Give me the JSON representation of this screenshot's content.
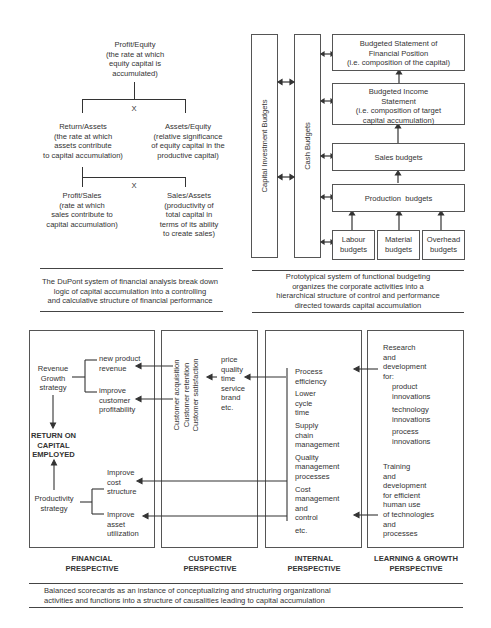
{
  "dupont": {
    "root": [
      "Profit/Equity",
      "(the rate at which",
      "equity capital is",
      "accumulated)"
    ],
    "multiply1": "X",
    "return_assets": [
      "Return/Assets",
      "(the rate at which",
      "assets contribute",
      "to capital accumulation)"
    ],
    "assets_equity": [
      "Assets/Equity",
      "(relative significance",
      "of equity capital in the",
      "productive capital)"
    ],
    "multiply2": "X",
    "profit_sales": [
      "Profit/Sales",
      "(rate at which",
      "sales contribute to",
      "capital accumulation)"
    ],
    "sales_assets": [
      "Sales/Assets",
      "(productivity of",
      "total capital in",
      "terms of its ability",
      "to create sales)"
    ],
    "caption": [
      "The DuPont system of financial analysis break down",
      "logic of capital accumulation into a controlling",
      "and calculative structure of financial performance"
    ]
  },
  "budgeting": {
    "capital_investment": "Capital Investment Budgets",
    "cash": "Cash Budgets",
    "statement_position": [
      "Budgeted Statement of",
      "Financial Position",
      "(i.e. composition of the capital)"
    ],
    "income_statement": [
      "Budgeted Income",
      "Statement",
      "(i.e. composition of target",
      "capital accumulation)"
    ],
    "sales": "Sales budgets",
    "production": "Production  budgets",
    "labour": [
      "Labour",
      "budgets"
    ],
    "material": [
      "Material",
      "budgets"
    ],
    "overhead": [
      "Overhead",
      "budgets"
    ],
    "caption": [
      "Prototypical system of functional budgeting",
      "organizes the corporate activities into a",
      "hierarchical structure of control and performance",
      "directed towards capital accumulation"
    ]
  },
  "scorecard": {
    "financial": {
      "revenue_growth": [
        "Revenue",
        "Growth",
        "strategy"
      ],
      "new_product": [
        "new product",
        "revenue"
      ],
      "improve_profitability": [
        "improve",
        "customer",
        "profitability"
      ],
      "roce": [
        "RETURN ON",
        "CAPITAL",
        "EMPLOYED"
      ],
      "productivity": [
        "Productivity",
        "strategy"
      ],
      "improve_cost": [
        "Improve",
        "cost",
        "structure"
      ],
      "improve_asset": [
        "Improve",
        "asset",
        "utilization"
      ],
      "label": [
        "FINANCIAL",
        "PRESPECTIVE"
      ]
    },
    "customer": {
      "rotated": [
        "Customer acquisition",
        "Customer retention",
        "Customer satisfaction"
      ],
      "attributes": [
        "price",
        "quality",
        "time",
        "service",
        "brand",
        "etc."
      ],
      "label": [
        "CUSTOMER",
        "PERSPECTIVE"
      ]
    },
    "internal": {
      "items": [
        [
          "Process",
          "efficiency"
        ],
        [
          "Lower",
          "cycle",
          "time"
        ],
        [
          "Supply",
          "chain",
          "management"
        ],
        [
          "Quality",
          "management",
          "processes"
        ],
        [
          "Cost",
          "management",
          "and",
          "control"
        ],
        [
          "etc."
        ]
      ],
      "label": [
        "INTERNAL",
        "PERSPECTIVE"
      ]
    },
    "learning": {
      "rd": [
        "Research",
        "and",
        "development",
        "for:"
      ],
      "product": [
        "product",
        "innovations"
      ],
      "technology": [
        "technology",
        "innovations"
      ],
      "process": [
        "process",
        "innovations"
      ],
      "training": [
        "Training",
        "and",
        "development",
        "for efficient",
        "human use",
        "of technologies",
        "and",
        "processes"
      ],
      "label": [
        "LEARNING & GROWTH",
        "PERSPECTIVE"
      ]
    },
    "caption": [
      "Balanced scorecards as an instance of conceptualizing and structuring organizational",
      "activities and functions into a structure of causalities leading to capital accumulation"
    ]
  }
}
